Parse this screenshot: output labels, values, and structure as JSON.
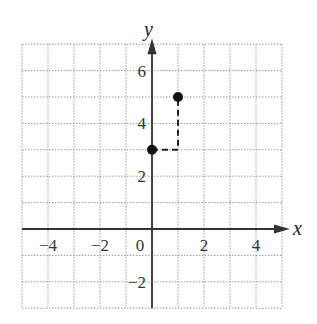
{
  "chart_data": {
    "type": "scatter",
    "title": "",
    "xlabel": "x",
    "ylabel": "y",
    "xlim": [
      -5,
      5
    ],
    "ylim": [
      -3,
      7
    ],
    "grid": true,
    "x_ticks": [
      -4,
      -2,
      0,
      2,
      4
    ],
    "y_ticks": [
      -2,
      2,
      4,
      6
    ],
    "x_tick_labels": [
      "−4",
      "−2",
      "0",
      "2",
      "4"
    ],
    "y_tick_labels": [
      "−2",
      "2",
      "4",
      "6"
    ],
    "points": [
      {
        "x": 0,
        "y": 3
      },
      {
        "x": 1,
        "y": 5
      }
    ],
    "dashed_path": [
      {
        "x": 0,
        "y": 3
      },
      {
        "x": 1,
        "y": 3
      },
      {
        "x": 1,
        "y": 5
      }
    ],
    "colors": {
      "axis": "#333333",
      "grid": "#9a9a9a",
      "points": "#111111"
    }
  }
}
